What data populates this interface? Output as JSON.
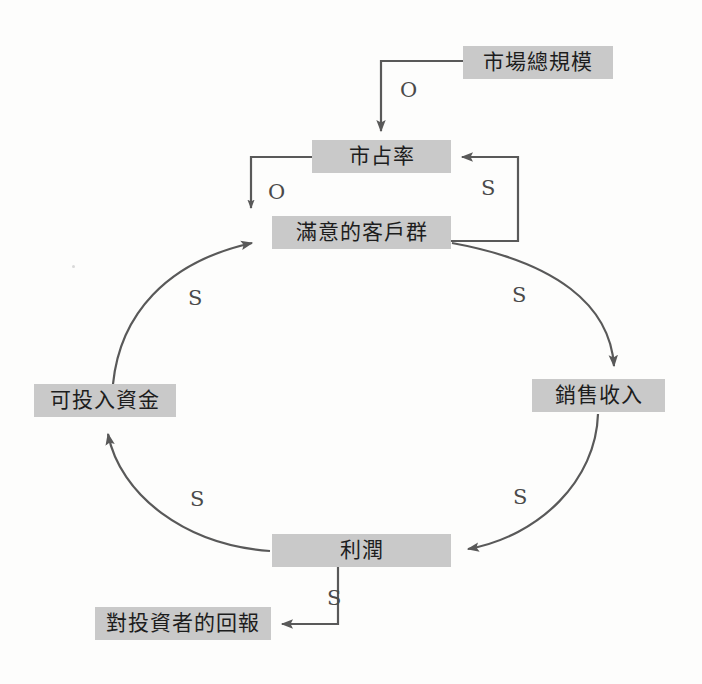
{
  "diagram": {
    "type": "causal-loop-diagram",
    "nodes": [
      {
        "id": "market_total_size",
        "label": "市場總規模",
        "x": 463,
        "y": 46,
        "w": 150,
        "h": 33
      },
      {
        "id": "market_share",
        "label": "市占率",
        "x": 312,
        "y": 140,
        "w": 139,
        "h": 33
      },
      {
        "id": "satisfied_customers",
        "label": "滿意的客戶群",
        "x": 272,
        "y": 216,
        "w": 179,
        "h": 33
      },
      {
        "id": "sales_revenue",
        "label": "銷售收入",
        "x": 532,
        "y": 379,
        "w": 133,
        "h": 33
      },
      {
        "id": "profit",
        "label": "利潤",
        "x": 272,
        "y": 534,
        "w": 179,
        "h": 33
      },
      {
        "id": "investable_funds",
        "label": "可投入資金",
        "x": 34,
        "y": 384,
        "w": 142,
        "h": 33
      },
      {
        "id": "return_to_investors",
        "label": "對投資者的回報",
        "x": 95,
        "y": 607,
        "w": 176,
        "h": 33
      }
    ],
    "edges": [
      {
        "id": "edge-market-size-to-share",
        "from": "market_total_size",
        "to": "market_share",
        "polarity": "O",
        "label_x": 400,
        "label_y": 80
      },
      {
        "id": "edge-share-to-satisfied",
        "from": "market_share",
        "to": "satisfied_customers",
        "polarity": "O",
        "label_x": 268,
        "label_y": 182
      },
      {
        "id": "edge-satisfied-to-share",
        "from": "satisfied_customers",
        "to": "market_share",
        "polarity": "S",
        "label_x": 481,
        "label_y": 178
      },
      {
        "id": "edge-satisfied-to-revenue",
        "from": "satisfied_customers",
        "to": "sales_revenue",
        "polarity": "S",
        "label_x": 512,
        "label_y": 285
      },
      {
        "id": "edge-revenue-to-profit",
        "from": "sales_revenue",
        "to": "profit",
        "polarity": "S",
        "label_x": 513,
        "label_y": 487
      },
      {
        "id": "edge-profit-to-funds",
        "from": "profit",
        "to": "investable_funds",
        "polarity": "S",
        "label_x": 190,
        "label_y": 489
      },
      {
        "id": "edge-funds-to-satisfied",
        "from": "investable_funds",
        "to": "satisfied_customers",
        "polarity": "S",
        "label_x": 188,
        "label_y": 288
      },
      {
        "id": "edge-profit-to-return",
        "from": "profit",
        "to": "return_to_investors",
        "polarity": "S",
        "label_x": 327,
        "label_y": 588
      }
    ],
    "colors": {
      "node_fill": "#c9c9c9",
      "node_text": "#1d1d1d",
      "arrow": "#595959",
      "label_text": "#4a4a4a",
      "background": "#fdfdfc"
    },
    "polarity_legend": {
      "S": "S",
      "O": "O"
    }
  }
}
